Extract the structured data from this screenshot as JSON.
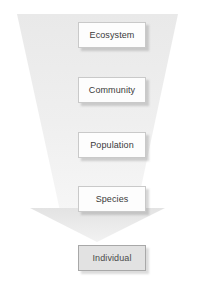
{
  "diagram": {
    "shape_name": "downward-funnel-arrow",
    "colors": {
      "funnel_fill_top": "#ededed",
      "funnel_fill_bottom": "#f4f4f4",
      "arrow_fill": "#e6e6e6",
      "box_fill": "#fdfdfd",
      "box_border": "#c9c9c9",
      "terminal_box_fill": "#e2e2e2",
      "terminal_box_border": "#a8a8a8",
      "text": "#3a3a3a",
      "background": "#ffffff"
    },
    "levels": [
      {
        "label": "Ecosystem",
        "x": 78,
        "y": 22,
        "w": 68,
        "h": 26,
        "terminal": false
      },
      {
        "label": "Community",
        "x": 78,
        "y": 77,
        "w": 68,
        "h": 26,
        "terminal": false
      },
      {
        "label": "Population",
        "x": 78,
        "y": 132,
        "w": 68,
        "h": 26,
        "terminal": false
      },
      {
        "label": "Species",
        "x": 78,
        "y": 186,
        "w": 68,
        "h": 26,
        "terminal": false
      },
      {
        "label": "Individual",
        "x": 78,
        "y": 245,
        "w": 68,
        "h": 26,
        "terminal": true
      }
    ]
  }
}
